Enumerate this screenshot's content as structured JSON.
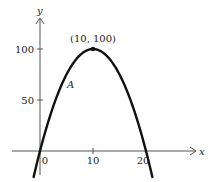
{
  "chart_data": {
    "type": "line",
    "title": "",
    "xlabel": "x",
    "ylabel": "y",
    "function": "y = 20x - x^2",
    "x": [
      0,
      2,
      4,
      6,
      8,
      10,
      12,
      14,
      16,
      18,
      20
    ],
    "y": [
      0,
      36,
      64,
      84,
      96,
      100,
      96,
      84,
      64,
      36,
      0
    ],
    "x_ticks": [
      0,
      10,
      20
    ],
    "y_ticks": [
      50,
      100
    ],
    "x_tick_labels": [
      "0",
      "10",
      "20"
    ],
    "y_tick_labels": [
      "50",
      "100"
    ],
    "annotations": [
      {
        "text": "(10, 100)",
        "x": 10,
        "y": 100,
        "type": "vertex"
      },
      {
        "text": "A",
        "x": 4.5,
        "y": 70,
        "type": "point-label"
      }
    ],
    "grid": false,
    "legend": null
  },
  "labels": {
    "x_axis": "x",
    "y_axis": "y",
    "tick_x_0": "0",
    "tick_x_10": "10",
    "tick_x_20": "20",
    "tick_y_50": "50",
    "tick_y_100": "100",
    "vertex": "(10, 100)",
    "point_a": "A"
  },
  "colors": {
    "curve": "#111111",
    "axis": "#555555",
    "background": "#ffffff"
  }
}
